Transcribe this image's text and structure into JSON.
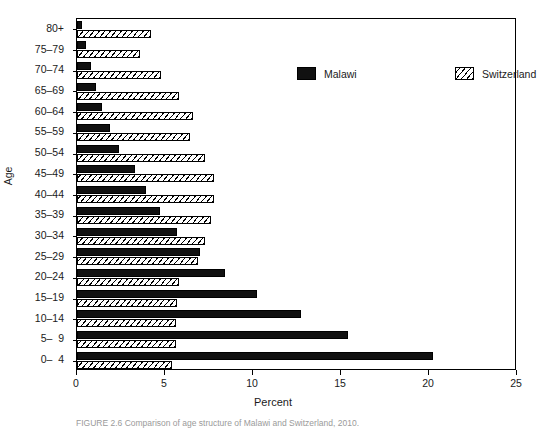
{
  "figure": {
    "caption": "FIGURE 2.6   Comparison of age structure of Malawi and Switzerland, 2010."
  },
  "axes": {
    "x": {
      "title": "Percent",
      "ticks": [
        0,
        5,
        10,
        15,
        20,
        25
      ],
      "tick_labels": [
        "0",
        "5",
        "10",
        "15",
        "20",
        "25"
      ],
      "min": 0,
      "max": 25
    },
    "y": {
      "title": "Age",
      "tick_labels": [
        "80+",
        "75–79",
        "70–74",
        "65–69",
        "60–64",
        "55–59",
        "50–54",
        "45–49",
        "40–44",
        "35–39",
        "30–34",
        "25–29",
        "20–24",
        "15–19",
        "10–14",
        "5–  9",
        "0–  4"
      ]
    }
  },
  "legend": {
    "position": "top-center",
    "items": [
      {
        "label": "Malawi",
        "swatch": "solid-black",
        "color": "#111111"
      },
      {
        "label": "Switzerland",
        "swatch": "diagonal-hatch",
        "color": "#ffffff"
      }
    ]
  },
  "chart_data": {
    "type": "bar",
    "orientation": "horizontal",
    "title": "",
    "subtitle": "",
    "xlabel": "Percent",
    "ylabel": "Age",
    "xlim": [
      0,
      25
    ],
    "grid": false,
    "legend_position": "top-center",
    "categories": [
      "80+",
      "75–79",
      "70–74",
      "65–69",
      "60–64",
      "55–59",
      "50–54",
      "45–49",
      "40–44",
      "35–39",
      "30–34",
      "25–29",
      "20–24",
      "15–19",
      "10–14",
      "5–9",
      "0–4"
    ],
    "series": [
      {
        "name": "Malawi",
        "values": [
          0.3,
          0.5,
          0.8,
          1.1,
          1.4,
          1.9,
          2.4,
          3.3,
          3.9,
          4.7,
          5.7,
          7.0,
          8.4,
          10.2,
          12.7,
          15.4,
          20.2
        ]
      },
      {
        "name": "Switzerland",
        "values": [
          4.2,
          3.6,
          4.8,
          5.8,
          6.6,
          6.4,
          7.3,
          7.8,
          7.8,
          7.6,
          7.3,
          6.9,
          5.8,
          5.7,
          5.6,
          5.6,
          5.4
        ]
      }
    ]
  }
}
